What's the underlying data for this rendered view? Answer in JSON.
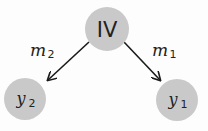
{
  "diagram": {
    "nodes": [
      {
        "id": "iv",
        "label": "IV",
        "fill": "#c9c9c9"
      },
      {
        "id": "y2",
        "label": "y",
        "sub": "2",
        "fill": "#c9c9c9"
      },
      {
        "id": "y1",
        "label": "y",
        "sub": "1",
        "fill": "#c9c9c9"
      }
    ],
    "edges": [
      {
        "from": "iv",
        "to": "y2",
        "label": "m",
        "sub": "2"
      },
      {
        "from": "iv",
        "to": "y1",
        "label": "m",
        "sub": "1"
      }
    ],
    "colors": {
      "node_fill": "#c9c9c9",
      "edge": "#1a1a1a",
      "text": "#222222"
    }
  }
}
